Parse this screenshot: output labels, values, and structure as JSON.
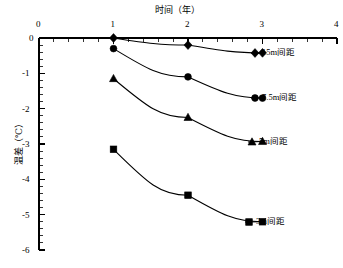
{
  "chart_data": {
    "type": "line",
    "title": "时间（年）",
    "xlabel": "时间（年）",
    "ylabel": "温差（℃）",
    "xlim": [
      0,
      4
    ],
    "ylim": [
      -6,
      0
    ],
    "x_ticks": [
      "0",
      "1",
      "2",
      "3",
      "4"
    ],
    "x_tick_values": [
      0,
      1,
      2,
      3,
      4
    ],
    "y_ticks": [
      "0",
      "-1",
      "-2",
      "-3",
      "-4",
      "-5",
      "-6"
    ],
    "y_tick_values": [
      0,
      -1,
      -2,
      -3,
      -4,
      -5,
      -6
    ],
    "x_minor_per_interval": 5,
    "y_minor_per_interval": 5,
    "grid": false,
    "legend_position": "inline-right",
    "x": [
      1,
      2,
      3
    ],
    "series": [
      {
        "name": "15m间距",
        "label": "15m间距",
        "marker": "diamond",
        "color": "#000000",
        "values": [
          0.0,
          -0.2,
          -0.42
        ]
      },
      {
        "name": "7.5m间距",
        "label": "7.5m间距",
        "marker": "circle",
        "color": "#000000",
        "values": [
          -0.3,
          -1.1,
          -1.7
        ]
      },
      {
        "name": "5m间距",
        "label": "5m间距",
        "marker": "triangle",
        "color": "#000000",
        "values": [
          -1.15,
          -2.25,
          -2.93
        ]
      },
      {
        "name": "3m间距",
        "label": "3m间距",
        "marker": "square",
        "color": "#000000",
        "values": [
          -3.15,
          -4.45,
          -5.2
        ]
      }
    ]
  },
  "axis": {
    "x_title": "时间（年）",
    "y_title": "温差（℃）",
    "x_tick_labels": [
      "0",
      "1",
      "2",
      "3",
      "4"
    ],
    "y_tick_labels": [
      "0",
      "-1",
      "-2",
      "-3",
      "-4",
      "-5",
      "-6"
    ]
  },
  "legend": {
    "items": [
      {
        "label": "15m间距",
        "marker": "diamond"
      },
      {
        "label": "7.5m间距",
        "marker": "circle"
      },
      {
        "label": "5m间距",
        "marker": "triangle"
      },
      {
        "label": "3m间距",
        "marker": "square"
      }
    ]
  }
}
